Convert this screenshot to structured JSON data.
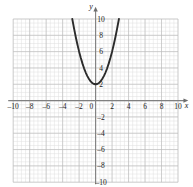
{
  "chart_data": {
    "type": "line",
    "title": "",
    "subtitle": "",
    "xlabel": "x",
    "ylabel": "y",
    "xlim": [
      -10,
      10
    ],
    "ylim": [
      -10,
      10
    ],
    "grid": true,
    "grid_major_step": 2,
    "grid_minor_step": 0.5,
    "legend": false,
    "legend_position": "none",
    "x_tick_labels": [
      "-10",
      "-8",
      "-6",
      "-4",
      "-2",
      "0",
      "2",
      "4",
      "6",
      "8",
      "10"
    ],
    "x_tick_values": [
      -10,
      -8,
      -6,
      -4,
      -2,
      0,
      2,
      4,
      6,
      8,
      10
    ],
    "y_tick_labels": [
      "10",
      "8",
      "6",
      "4",
      "2",
      "-2",
      "-4",
      "-6",
      "-8",
      "-10"
    ],
    "y_tick_values": [
      10,
      8,
      6,
      4,
      2,
      -2,
      -4,
      -6,
      -8,
      -10
    ],
    "origin_label": "0",
    "series": [
      {
        "name": "parabola",
        "equation": "y = x^2 + 2",
        "color": "#2b2b2b",
        "vertex": [
          0,
          2
        ],
        "x": [
          -2.83,
          -2.6,
          -2.4,
          -2.2,
          -2.0,
          -1.8,
          -1.6,
          -1.4,
          -1.2,
          -1.0,
          -0.8,
          -0.6,
          -0.4,
          -0.2,
          0,
          0.2,
          0.4,
          0.6,
          0.8,
          1.0,
          1.2,
          1.4,
          1.6,
          1.8,
          2.0,
          2.2,
          2.4,
          2.6,
          2.83
        ],
        "values": [
          10.0,
          8.76,
          7.76,
          6.84,
          6.0,
          5.24,
          4.56,
          3.96,
          3.44,
          3.0,
          2.64,
          2.36,
          2.16,
          2.04,
          2.0,
          2.04,
          2.16,
          2.36,
          2.64,
          3.0,
          3.44,
          3.96,
          4.56,
          5.24,
          6.0,
          6.84,
          7.76,
          8.76,
          10.0
        ]
      }
    ],
    "colors": {
      "curve": "#2b2b2b",
      "axis": "#808080",
      "grid_major": "#b5b5b5",
      "grid_minor": "#dcdcdc",
      "label": "#1a1a1a",
      "background": "#ffffff"
    }
  }
}
